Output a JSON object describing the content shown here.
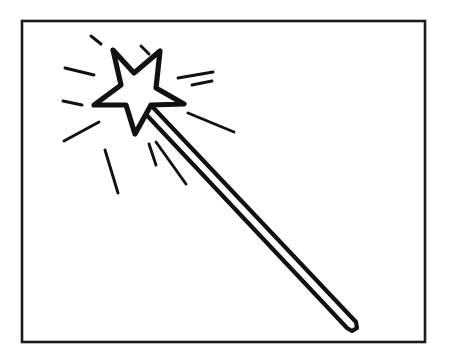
{
  "artwork": {
    "title": "Magic Wand",
    "subject": "magic-wand-with-star-and-sparkle-rays",
    "style": "black-and-white-line-art-coloring-page",
    "canvas": {
      "width": 449,
      "height": 364,
      "background": "#ffffff"
    },
    "ink_color": "#111111",
    "frame": {
      "name": "border-rectangle",
      "x": 22,
      "y": 21,
      "width": 403,
      "height": 321,
      "stroke_width": 2.6,
      "stroke_color": "#1a1a1a",
      "fill": "#ffffff"
    },
    "star": {
      "name": "five-point-star",
      "fill": "#ffffff",
      "stroke_color": "#111111",
      "stroke_width": 5.2,
      "points": "113,50 134,73 160,51 156,88 184,104 151,105 135,134 126,105 94,105 121,85"
    },
    "wand_shaft": {
      "name": "wand-handle",
      "description": "long tapering diagonal stick from star down to lower right with rounded tip",
      "fill": "#ffffff",
      "stroke_color": "#111111",
      "stroke_width": 4.2,
      "top_anchor": [
        146,
        100
      ],
      "tip": [
        356,
        326
      ],
      "outline": "146,100 356,322 357,328 352,331 347,328 140,108"
    },
    "rays": [
      {
        "name": "ray-top-left-short",
        "x1": 91,
        "y1": 36,
        "x2": 101,
        "y2": 44,
        "width": 2.9
      },
      {
        "name": "ray-top-mid-short",
        "x1": 141,
        "y1": 46,
        "x2": 149,
        "y2": 54,
        "width": 2.9
      },
      {
        "name": "ray-left-upper",
        "x1": 65,
        "y1": 68,
        "x2": 94,
        "y2": 75,
        "width": 2.9
      },
      {
        "name": "ray-left-mid-short",
        "x1": 63,
        "y1": 101,
        "x2": 82,
        "y2": 105,
        "width": 2.9
      },
      {
        "name": "ray-left-lower",
        "x1": 64,
        "y1": 141,
        "x2": 99,
        "y2": 122,
        "width": 2.9
      },
      {
        "name": "ray-bottom-far-left",
        "x1": 105,
        "y1": 150,
        "x2": 118,
        "y2": 193,
        "width": 2.9
      },
      {
        "name": "ray-bottom-mid",
        "x1": 149,
        "y1": 144,
        "x2": 156,
        "y2": 165,
        "width": 2.9
      },
      {
        "name": "ray-bottom-right",
        "x1": 156,
        "y1": 142,
        "x2": 186,
        "y2": 184,
        "width": 2.9
      },
      {
        "name": "ray-right-upper-one",
        "x1": 178,
        "y1": 78,
        "x2": 213,
        "y2": 72,
        "width": 2.9
      },
      {
        "name": "ray-right-upper-two",
        "x1": 192,
        "y1": 85,
        "x2": 212,
        "y2": 81,
        "width": 2.9
      },
      {
        "name": "ray-right-mid",
        "x1": 188,
        "y1": 113,
        "x2": 234,
        "y2": 132,
        "width": 2.9
      }
    ]
  }
}
